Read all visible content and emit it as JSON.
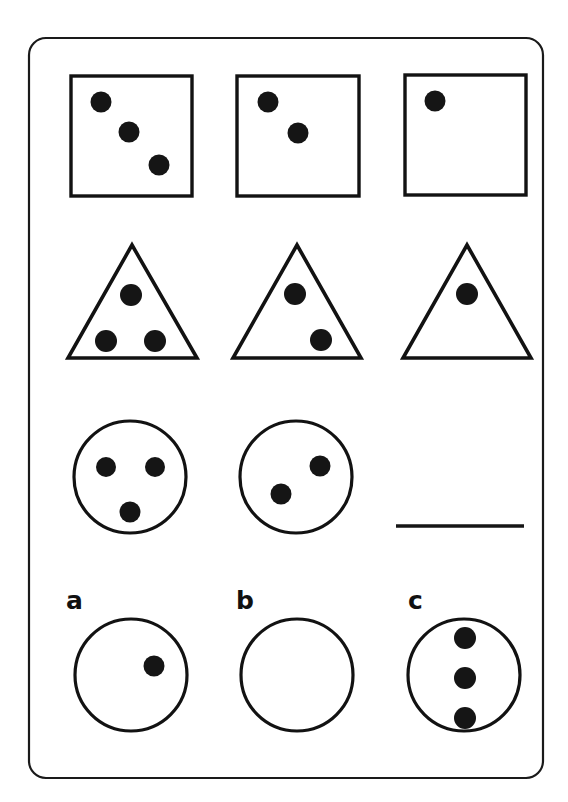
{
  "page": {
    "width": 568,
    "height": 802,
    "background_color": "#ffffff",
    "border_color": "#1a1a1a",
    "shape_stroke_color": "#121212",
    "dot_color": "#151515"
  },
  "puzzle": {
    "type": "visual-analogy-sequence",
    "rule": "Each row shows the same shape with a decreasing number of dots: 3, then 2, then 1.",
    "rows": [
      {
        "row_index": 0,
        "shape": "square",
        "cells": [
          {
            "shape": "square",
            "dot_count": 3,
            "dot_layout": "diagonal"
          },
          {
            "shape": "square",
            "dot_count": 2,
            "dot_layout": "diagonal"
          },
          {
            "shape": "square",
            "dot_count": 1,
            "dot_layout": "upper-left"
          }
        ]
      },
      {
        "row_index": 1,
        "shape": "triangle",
        "cells": [
          {
            "shape": "triangle",
            "dot_count": 3,
            "dot_layout": "triangular"
          },
          {
            "shape": "triangle",
            "dot_count": 2,
            "dot_layout": "diagonal"
          },
          {
            "shape": "triangle",
            "dot_count": 1,
            "dot_layout": "center-top"
          }
        ]
      },
      {
        "row_index": 2,
        "shape": "circle",
        "cells": [
          {
            "shape": "circle",
            "dot_count": 3,
            "dot_layout": "triangular"
          },
          {
            "shape": "circle",
            "dot_count": 2,
            "dot_layout": "diagonal"
          },
          {
            "shape": "blank-answer-line",
            "dot_count": 0,
            "dot_layout": "none"
          }
        ]
      }
    ]
  },
  "options": {
    "prompt_shape": "circle",
    "items": [
      {
        "label": "a",
        "shape": "circle",
        "dot_count": 1,
        "dot_layout": "right-of-center"
      },
      {
        "label": "b",
        "shape": "circle",
        "dot_count": 0,
        "dot_layout": "none"
      },
      {
        "label": "c",
        "shape": "circle",
        "dot_count": 3,
        "dot_layout": "vertical-stack"
      }
    ]
  }
}
